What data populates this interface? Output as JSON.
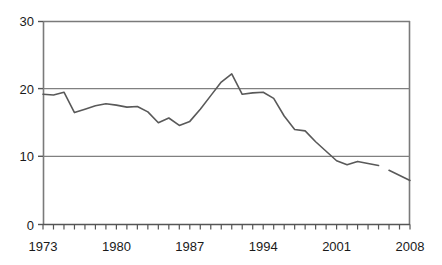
{
  "chart_data": {
    "type": "line",
    "title": "",
    "subtitle": "",
    "xlabel": "",
    "ylabel": "",
    "xlim": [
      1973,
      2008
    ],
    "ylim": [
      0,
      30
    ],
    "yticks": [
      0,
      10,
      20,
      30
    ],
    "ytick_labels": [
      "0",
      "10",
      "20",
      "30"
    ],
    "xticks": [
      1973,
      1980,
      1987,
      1994,
      2001,
      2008
    ],
    "xtick_labels": [
      "1973",
      "1980",
      "1987",
      "1994",
      "2001",
      "2008"
    ],
    "xtick_minor_step": 1,
    "grid": "horizontal gridlines at 10 and 20",
    "legend": "none",
    "line_color": "#595959",
    "gridline_color": "#808080",
    "axis_color": "#7a7a7a",
    "series": [
      {
        "name": "series-1",
        "x": [
          1973,
          1974,
          1975,
          1976,
          1977,
          1978,
          1979,
          1980,
          1981,
          1982,
          1983,
          1984,
          1985,
          1986,
          1987,
          1988,
          1989,
          1990,
          1991,
          1992,
          1993,
          1994,
          1995,
          1996,
          1997,
          1998,
          1999,
          2000,
          2001,
          2002,
          2003,
          2004,
          2005
        ],
        "values": [
          19.2,
          19.1,
          19.5,
          16.5,
          17.0,
          17.5,
          17.8,
          17.6,
          17.3,
          17.4,
          16.6,
          15.0,
          15.7,
          14.6,
          15.2,
          17.0,
          19.0,
          21.0,
          22.2,
          19.2,
          19.4,
          19.5,
          18.6,
          16.0,
          14.0,
          13.8,
          12.2,
          10.8,
          9.4,
          8.8,
          9.3,
          9.0,
          8.7
        ]
      },
      {
        "name": "series-1-continued",
        "x": [
          2006,
          2008
        ],
        "values": [
          8.0,
          6.5
        ]
      }
    ]
  }
}
